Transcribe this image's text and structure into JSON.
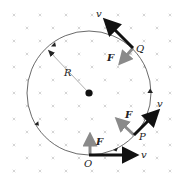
{
  "figure": {
    "field_marks": "x",
    "colors": {
      "velocity": "#111111",
      "force": "#8a8a8a",
      "circle": "#444444",
      "field": "#b8b8b8"
    },
    "center": {
      "x": 89,
      "y": 93
    },
    "radius_px": 62,
    "radius_label": "R",
    "points": [
      {
        "name": "O",
        "label": "O",
        "x": 89,
        "y": 155,
        "v_label": "v",
        "F_label": "F"
      },
      {
        "name": "P",
        "label": "P",
        "x": 134,
        "y": 135,
        "v_label": "v",
        "F_label": "F"
      },
      {
        "name": "Q",
        "label": "Q",
        "x": 133,
        "y": 48,
        "v_label": "v",
        "F_label": "F"
      }
    ],
    "direction": "counterclockwise"
  }
}
